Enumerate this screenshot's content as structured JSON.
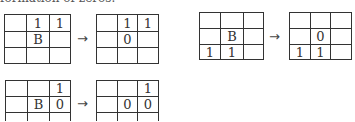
{
  "caption_cut": "formation of zeros.",
  "arrow_glyph": "→",
  "examples": [
    {
      "before": [
        [
          "",
          "1",
          "1"
        ],
        [
          "",
          "B",
          ""
        ],
        [
          "",
          "",
          ""
        ]
      ],
      "after": [
        [
          "",
          "1",
          "1"
        ],
        [
          "",
          "0",
          ""
        ],
        [
          "",
          "",
          ""
        ]
      ]
    },
    {
      "before": [
        [
          "",
          "",
          ""
        ],
        [
          "",
          "B",
          ""
        ],
        [
          "1",
          "1",
          ""
        ]
      ],
      "after": [
        [
          "",
          "",
          ""
        ],
        [
          "",
          "0",
          ""
        ],
        [
          "1",
          "1",
          ""
        ]
      ]
    },
    {
      "before": [
        [
          "",
          "",
          "1"
        ],
        [
          "",
          "B",
          "0"
        ],
        [
          "",
          "",
          ""
        ]
      ],
      "after": [
        [
          "",
          "",
          "1"
        ],
        [
          "",
          "0",
          "0"
        ],
        [
          "",
          "",
          ""
        ]
      ]
    }
  ]
}
